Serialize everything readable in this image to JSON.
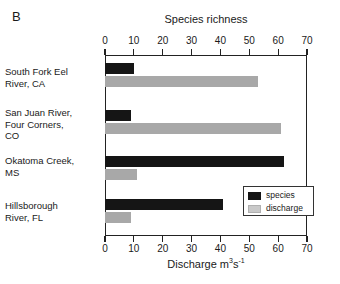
{
  "panel": {
    "letter": "B"
  },
  "axes": {
    "top_title": "Species richness",
    "bottom_title_main": "Discharge m",
    "bottom_title_sup1": "3",
    "bottom_title_mid": "s",
    "bottom_title_sup2": "-1",
    "ticks": [
      "0",
      "10",
      "20",
      "30",
      "40",
      "50",
      "60",
      "70"
    ]
  },
  "legend": {
    "items": [
      {
        "label": "species",
        "color": "#151515"
      },
      {
        "label": "discharge",
        "color": "#c9c9c9"
      }
    ]
  },
  "chart_data": {
    "type": "bar",
    "orientation": "horizontal",
    "title": "Species richness",
    "panel_label": "B",
    "categories": [
      "South Fork Eel River, CA",
      "San Juan River, Four Corners, CO",
      "Okatoma Creek, MS",
      "Hillsborough River, FL"
    ],
    "category_lines": [
      [
        "South Fork Eel",
        "River, CA"
      ],
      [
        "San Juan River,",
        "Four Corners,",
        "CO"
      ],
      [
        "Okatoma Creek,",
        "MS"
      ],
      [
        "Hillsborough",
        "River, FL"
      ]
    ],
    "series": [
      {
        "name": "species",
        "values": [
          10,
          9,
          62,
          41
        ],
        "color": "#151515",
        "axis": "top",
        "axis_label": "Species richness"
      },
      {
        "name": "discharge",
        "values": [
          53,
          61,
          11,
          9
        ],
        "color": "#a8a8a8",
        "axis": "bottom",
        "axis_label": "Discharge m3s-1"
      }
    ],
    "xlim": [
      0,
      70
    ],
    "xticks": [
      0,
      10,
      20,
      30,
      40,
      50,
      60,
      70
    ],
    "top_axis_label": "Species richness",
    "bottom_axis_label": "Discharge m3s-1",
    "grid": false,
    "legend_position": "inside-lower-right"
  }
}
